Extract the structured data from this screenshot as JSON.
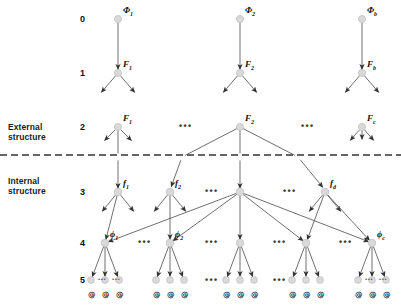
{
  "figure": {
    "type": "hierarchical-tree-diagram",
    "side_labels": [
      {
        "id": "external",
        "line1": "External",
        "line2": "structure",
        "x": 8,
        "y": 122
      },
      {
        "id": "internal",
        "line1": "Internal",
        "line2": "structure",
        "x": 8,
        "y": 176
      }
    ],
    "row_numbers": [
      {
        "label": "0",
        "y": 19
      },
      {
        "label": "1",
        "y": 73
      },
      {
        "label": "2",
        "y": 127
      },
      {
        "label": "3",
        "y": 192
      },
      {
        "label": "4",
        "y": 243
      },
      {
        "label": "5",
        "y": 280
      }
    ],
    "divider": {
      "y": 155,
      "style": "dashed",
      "color": "#333333"
    },
    "node_color": "#d9d9d9",
    "node_stroke": "#bdbdbd",
    "edge_color": "#555555",
    "terminal_symbol": "@",
    "levels": [
      {
        "level": 0,
        "nodes": [
          {
            "x": 118,
            "label": "Φ",
            "sub": "1"
          },
          {
            "x": 240,
            "label": "Φ",
            "sub": "2"
          },
          {
            "x": 362,
            "label": "Φ",
            "sub": "b"
          }
        ]
      },
      {
        "level": 1,
        "nodes": [
          {
            "x": 118,
            "label": "F",
            "sub": "1"
          },
          {
            "x": 240,
            "label": "F",
            "sub": "2"
          },
          {
            "x": 362,
            "label": "F",
            "sub": "b"
          }
        ]
      },
      {
        "level": 2,
        "nodes": [
          {
            "x": 118,
            "label": "F",
            "sub": "1"
          },
          {
            "x": 240,
            "label": "F",
            "sub": "2"
          },
          {
            "x": 362,
            "label": "F",
            "sub": "c"
          }
        ]
      },
      {
        "level": 3,
        "nodes": [
          {
            "x": 118,
            "label": "f",
            "sub": "1"
          },
          {
            "x": 170,
            "label": "f",
            "sub": "2"
          },
          {
            "x": 240,
            "label": "",
            "sub": ""
          },
          {
            "x": 325,
            "label": "f",
            "sub": "d"
          }
        ]
      },
      {
        "level": 4,
        "nodes": [
          {
            "x": 105,
            "label": "ϕ",
            "sub": "1"
          },
          {
            "x": 170,
            "label": "ϕ",
            "sub": "2"
          },
          {
            "x": 240,
            "label": "",
            "sub": ""
          },
          {
            "x": 306,
            "label": "",
            "sub": ""
          },
          {
            "x": 372,
            "label": "ϕ",
            "sub": "c"
          }
        ]
      },
      {
        "level": 5,
        "group_centers": [
          105,
          170,
          240,
          306,
          372
        ],
        "leaves_per_group": 3
      }
    ],
    "ellipses_level2": [
      {
        "x": 179,
        "y": 127
      },
      {
        "x": 301,
        "y": 127
      }
    ],
    "ellipses_level3": [
      {
        "x": 205,
        "y": 192
      },
      {
        "x": 283,
        "y": 192
      }
    ],
    "ellipses_level4": [
      {
        "x": 138,
        "y": 243
      },
      {
        "x": 205,
        "y": 243
      },
      {
        "x": 273,
        "y": 243
      },
      {
        "x": 339,
        "y": 243
      }
    ],
    "ellipses_level5": [
      {
        "x": 205,
        "y": 281
      },
      {
        "x": 273,
        "y": 281
      }
    ]
  }
}
